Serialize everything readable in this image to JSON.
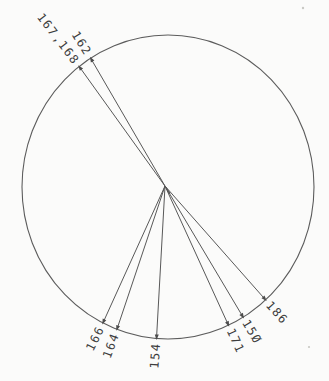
{
  "chart_data": {
    "type": "radial",
    "title": "",
    "legend": "none",
    "grid": "off",
    "points": [
      {
        "label": "167,168",
        "angle_deg": -127.5
      },
      {
        "label": "162",
        "angle_deg": -122.0
      },
      {
        "label": "166",
        "angle_deg": 116.5
      },
      {
        "label": "164",
        "angle_deg": 110.5
      },
      {
        "label": "154",
        "angle_deg": 94.5
      },
      {
        "label": "171",
        "angle_deg": 65.5
      },
      {
        "label": "150",
        "angle_deg": 59.0
      },
      {
        "label": "186",
        "angle_deg": 48.0
      }
    ],
    "layout": {
      "angle_convention": "degrees clockwise from +x axis in screen coords (y down), measured at circle center; lines run from central hub to circle rim",
      "center": [
        168,
        187
      ],
      "radius_x": 146,
      "radius_y": 152,
      "hub": [
        165,
        186
      ],
      "label_placement": "radial, outside rim; left-side labels read inward to rim, right-side labels read outward from rim",
      "zero_glyph": "slashed zero (plotter font)"
    },
    "colors": {
      "line": "#585858",
      "text": "#3d3d3d",
      "background": "#fbfbfa"
    }
  }
}
